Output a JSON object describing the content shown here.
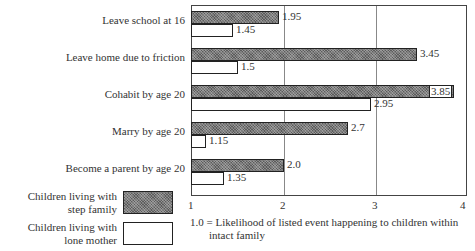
{
  "chart_data": {
    "type": "bar",
    "orientation": "horizontal",
    "title": "",
    "xlabel": "",
    "ylabel": "",
    "xlim": [
      1,
      4
    ],
    "x_ticks": [
      "1",
      "2",
      "3",
      "4"
    ],
    "grid": "vertical lines at 2 and 3",
    "categories": [
      "Leave school at 16",
      "Leave home due to friction",
      "Cohabit by age 20",
      "Marry by age 20",
      "Become a parent by age 20"
    ],
    "series": [
      {
        "name": "Children living with step family",
        "values": [
          1.95,
          3.45,
          3.85,
          2.7,
          2.0
        ],
        "labels": [
          "1.95",
          "3.45",
          "3.85",
          "2.7",
          "2.0"
        ],
        "fill": "hatched dark grey"
      },
      {
        "name": "Children living with lone mother",
        "values": [
          1.45,
          1.5,
          2.95,
          1.15,
          1.35
        ],
        "labels": [
          "1.45",
          "1.5",
          "2.95",
          "1.15",
          "1.35"
        ],
        "fill": "white"
      }
    ],
    "legend_position": "bottom-left",
    "annotation": "1.0 = Likelihood of listed event happening to children within intact family"
  },
  "legend": {
    "step": "Children living with step family",
    "step_line1": "Children living with",
    "step_line2": "step family",
    "lone_line1": "Children living with",
    "lone_line2": "lone mother"
  },
  "note": {
    "line1": "1.0 = Likelihood of listed event happening to children within",
    "line2": "intact family"
  }
}
